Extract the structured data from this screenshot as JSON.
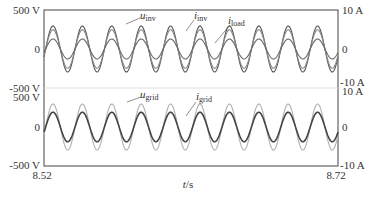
{
  "chart_data": [
    {
      "type": "line",
      "panel": "top",
      "x_range": [
        8.52,
        8.72
      ],
      "frequency_hz": 50,
      "left_axis": {
        "label_top": "500 V",
        "label_mid": "0",
        "label_bottom": "-500 V",
        "ylim": [
          -500,
          500
        ]
      },
      "right_axis": {
        "label_top": "10 A",
        "label_mid": "0",
        "label_bottom": "-10 A",
        "ylim": [
          -10,
          10
        ]
      },
      "series": [
        {
          "name": "u_inv",
          "label_main": "u",
          "label_sub": "inv",
          "amplitude": 311,
          "unit": "V",
          "axis": "left",
          "color": "#555555"
        },
        {
          "name": "i_inv",
          "label_main": "i",
          "label_sub": "inv",
          "amplitude": 5.2,
          "unit": "A",
          "axis": "right",
          "color": "#888888"
        },
        {
          "name": "i_load",
          "label_main": "i",
          "label_sub": "load",
          "amplitude": 2.7,
          "unit": "A",
          "axis": "right",
          "color": "#666666"
        }
      ]
    },
    {
      "type": "line",
      "panel": "bottom",
      "x_range": [
        8.52,
        8.72
      ],
      "frequency_hz": 50,
      "left_axis": {
        "label_top": "500 V",
        "label_mid": "0",
        "label_bottom": "-500 V",
        "ylim": [
          -500,
          500
        ]
      },
      "right_axis": {
        "label_top": "10 A",
        "label_mid": "0",
        "label_bottom": "-10 A",
        "ylim": [
          -10,
          10
        ]
      },
      "series": [
        {
          "name": "u_grid",
          "label_main": "u",
          "label_sub": "grid",
          "amplitude": 311,
          "unit": "V",
          "axis": "left",
          "color": "#b0b0b0"
        },
        {
          "name": "i_grid",
          "label_main": "i",
          "label_sub": "grid",
          "amplitude": 4.0,
          "unit": "A",
          "axis": "right",
          "color": "#444444"
        }
      ]
    }
  ],
  "axes": {
    "x_start": "8.52",
    "x_end": "8.72",
    "xlabel_main": "t",
    "xlabel_unit": "/s"
  },
  "labels": {
    "top_left_top": "500 V",
    "top_left_mid": "0",
    "top_left_bottom": "-500 V",
    "top_right_top": "10 A",
    "top_right_mid": "0",
    "top_right_bottom": "-10 A",
    "bot_left_top": "500 V",
    "bot_left_mid": "0",
    "bot_left_bottom": "-500 V",
    "bot_right_top": "10 A",
    "bot_right_mid": "0",
    "bot_right_bottom": "-10 A",
    "u": "u",
    "i": "i",
    "inv": "inv",
    "load": "load",
    "grid": "grid"
  }
}
